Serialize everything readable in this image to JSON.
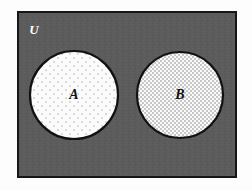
{
  "figure": {
    "kind": "venn-diagram",
    "canvas": {
      "width": 252,
      "height": 190,
      "background": "#fdfdfd"
    }
  },
  "universe": {
    "label": "U",
    "label_color": "#ffffff",
    "fill_color": "#5c5c5c",
    "border_color": "#161616",
    "border_width": 2,
    "x": 18,
    "y": 12,
    "width": 218,
    "height": 165,
    "label_x": 34,
    "label_y": 31
  },
  "sets": [
    {
      "label": "A",
      "label_color": "#111111",
      "fill_color": "#fbfbfb",
      "pattern": "sparse-dots",
      "pattern_color": "#b9b9b9",
      "border_color": "#111111",
      "border_width": 2,
      "cx": 74,
      "cy": 95,
      "r": 44
    },
    {
      "label": "B",
      "label_color": "#111111",
      "fill_color": "#f2f2f2",
      "pattern": "fine-checkerboard",
      "pattern_color": "#c9c9c9",
      "border_color": "#111111",
      "border_width": 2,
      "cx": 180,
      "cy": 95,
      "r": 43
    }
  ],
  "chart_data": {
    "type": "diagram",
    "diagram_type": "venn",
    "title": "",
    "relationship": "disjoint",
    "universe_label": "U",
    "set_labels": [
      "A",
      "B"
    ],
    "intersection": "empty",
    "regions": [
      {
        "name": "A only",
        "shaded": true,
        "pattern": "sparse-dots"
      },
      {
        "name": "B only",
        "shaded": true,
        "pattern": "fine-checkerboard"
      },
      {
        "name": "A intersect B",
        "shaded": false,
        "pattern": "none"
      },
      {
        "name": "U outside A and B",
        "shaded": true,
        "pattern": "solid-gray"
      }
    ]
  }
}
